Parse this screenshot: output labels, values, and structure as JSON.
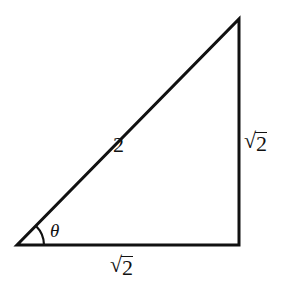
{
  "diagram": {
    "type": "right-triangle",
    "vertices": {
      "bottom_left": [
        17,
        245
      ],
      "bottom_right": [
        239,
        245
      ],
      "top_right": [
        239,
        19
      ]
    },
    "stroke_color": "#111111",
    "labels": {
      "hypotenuse": "2",
      "vertical_leg": {
        "radical": "√",
        "value": "2"
      },
      "horizontal_leg": {
        "radical": "√",
        "value": "2"
      },
      "angle": "θ"
    }
  }
}
